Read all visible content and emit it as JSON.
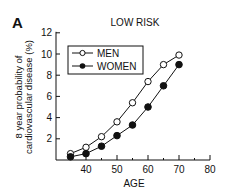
{
  "panel_label": "A",
  "chart_data": {
    "type": "line",
    "title": "LOW RISK",
    "xlabel": "AGE",
    "ylabel_lines": [
      "8 year probability of",
      "cardiovascular disease (%)"
    ],
    "ylabel": "8 year probability of cardiovascular disease (%)",
    "xlim": [
      30,
      80
    ],
    "ylim": [
      0,
      12
    ],
    "xticks": [
      40,
      50,
      60,
      70,
      80
    ],
    "yticks": [
      2,
      4,
      6,
      8,
      10,
      12
    ],
    "grid": false,
    "legend_position": "upper left (boxed)",
    "x": [
      35,
      40,
      45,
      50,
      55,
      60,
      65,
      70
    ],
    "series": [
      {
        "name": "MEN",
        "marker": "open-circle",
        "values": [
          0.6,
          1.2,
          2.2,
          3.6,
          5.4,
          7.4,
          9.0,
          9.9
        ]
      },
      {
        "name": "WOMEN",
        "marker": "filled-circle",
        "values": [
          0.3,
          0.6,
          1.3,
          2.3,
          3.3,
          5.0,
          7.0,
          9.0
        ]
      }
    ]
  }
}
